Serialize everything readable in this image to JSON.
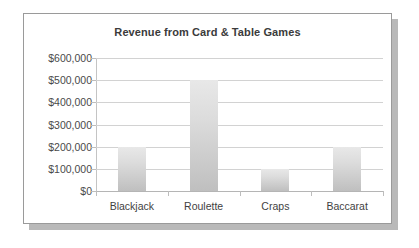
{
  "chart_data": {
    "type": "bar",
    "title": "Revenue from Card & Table Games",
    "xlabel": "",
    "ylabel": "",
    "categories": [
      "Blackjack",
      "Roulette",
      "Craps",
      "Baccarat"
    ],
    "values": [
      200000,
      500000,
      100000,
      200000
    ],
    "ylim": [
      0,
      600000
    ],
    "ytick_step": 100000,
    "ytick_labels": [
      "$600,000",
      "$500,000",
      "$400,000",
      "$300,000",
      "$200,000",
      "$100,000",
      "$0"
    ],
    "ytick_values": [
      600000,
      500000,
      400000,
      300000,
      200000,
      100000,
      0
    ],
    "grid": true,
    "legend": false,
    "legend_position": "none",
    "colors": {
      "bar_top": "#e8e8e8",
      "bar_bottom": "#bfbfbf",
      "gridline": "#d2d2d2",
      "axis": "#c4c4c4",
      "title_text": "#3b3b3b",
      "label_text": "#4a4a4a",
      "card_border": "#9a9a9a",
      "card_shadow": "#b9b9b9",
      "background": "#ffffff"
    }
  }
}
